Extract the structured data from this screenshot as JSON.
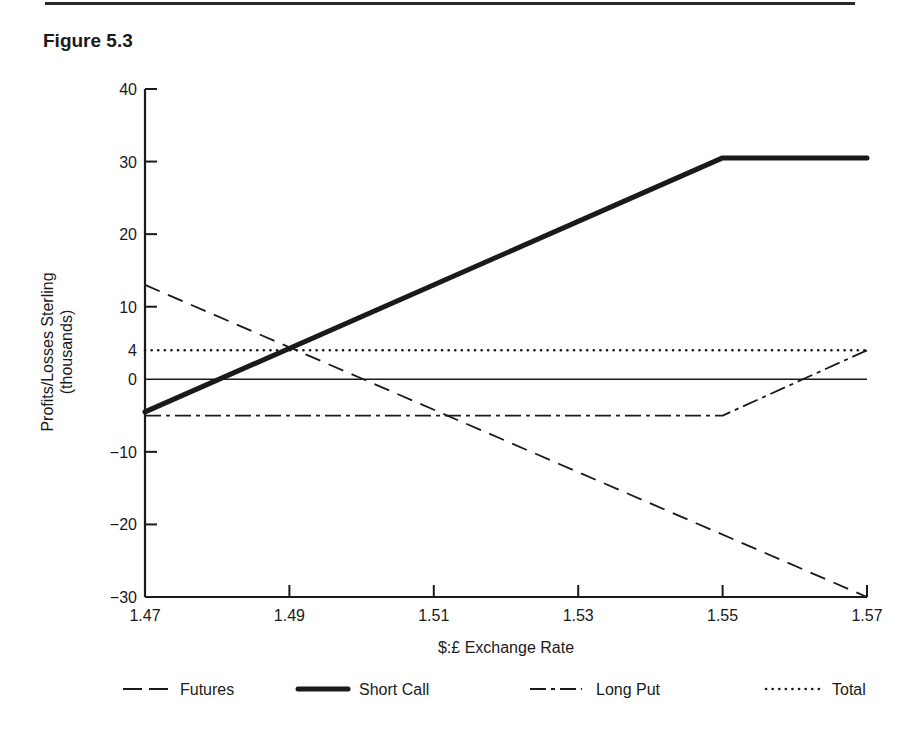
{
  "figure": {
    "title": "Figure 5.3"
  },
  "chart_data": {
    "type": "line",
    "title": "Figure 5.3",
    "xlabel": "$:£ Exchange Rate",
    "ylabel": "Profits/Losses Sterling",
    "ylabel_sub": "(thousands)",
    "xlim": [
      1.47,
      1.57
    ],
    "ylim": [
      -30,
      40
    ],
    "x_ticks": [
      "1.47",
      "1.49",
      "1.51",
      "1.53",
      "1.55",
      "1.57"
    ],
    "y_ticks": [
      "40",
      "30",
      "20",
      "10",
      "4",
      "0",
      "−10",
      "−20",
      "−30"
    ],
    "y_tick_values": [
      40,
      30,
      20,
      10,
      4,
      0,
      -10,
      -20,
      -30
    ],
    "grid": false,
    "zero_line": true,
    "legend_position": "bottom",
    "series": [
      {
        "name": "Futures",
        "style": "dashed",
        "x": [
          1.47,
          1.57
        ],
        "y": [
          13,
          -30
        ]
      },
      {
        "name": "Short Call",
        "style": "thick-solid",
        "x": [
          1.47,
          1.55,
          1.57
        ],
        "y": [
          -4.5,
          30.5,
          30.5
        ]
      },
      {
        "name": "Long Put",
        "style": "dash-dot",
        "x": [
          1.47,
          1.55,
          1.57
        ],
        "y": [
          -5,
          -5,
          4
        ]
      },
      {
        "name": "Total",
        "style": "dotted",
        "x": [
          1.47,
          1.57
        ],
        "y": [
          4,
          4
        ]
      }
    ]
  },
  "colors": {
    "ink": "#1a1a1a",
    "background": "#ffffff"
  }
}
